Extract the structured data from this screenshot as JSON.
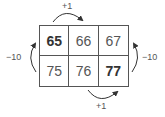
{
  "grid": {
    "rows": [
      [
        {
          "value": "65",
          "bold": true
        },
        {
          "value": "66",
          "bold": false
        },
        {
          "value": "67",
          "bold": false
        }
      ],
      [
        {
          "value": "75",
          "bold": false
        },
        {
          "value": "76",
          "bold": false
        },
        {
          "value": "77",
          "bold": true
        }
      ]
    ]
  },
  "arrows": {
    "top": {
      "label": "+1"
    },
    "bottom": {
      "label": "+1"
    },
    "left": {
      "label": "−10"
    },
    "right": {
      "label": "−10"
    }
  }
}
